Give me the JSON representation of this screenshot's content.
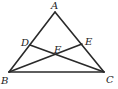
{
  "diagram": {
    "type": "triangle",
    "points": {
      "A": {
        "label": "A",
        "x": 55,
        "y": 12
      },
      "B": {
        "label": "B",
        "x": 9,
        "y": 72
      },
      "C": {
        "label": "C",
        "x": 104,
        "y": 72
      },
      "D": {
        "label": "D",
        "x": 30,
        "y": 45
      },
      "E": {
        "label": "E",
        "x": 82,
        "y": 44
      },
      "F": {
        "label": "F",
        "x": 57,
        "y": 55
      }
    },
    "segments": [
      "AB",
      "AC",
      "BC",
      "BE",
      "CD"
    ],
    "stroke_color": "#2a2a2a"
  }
}
